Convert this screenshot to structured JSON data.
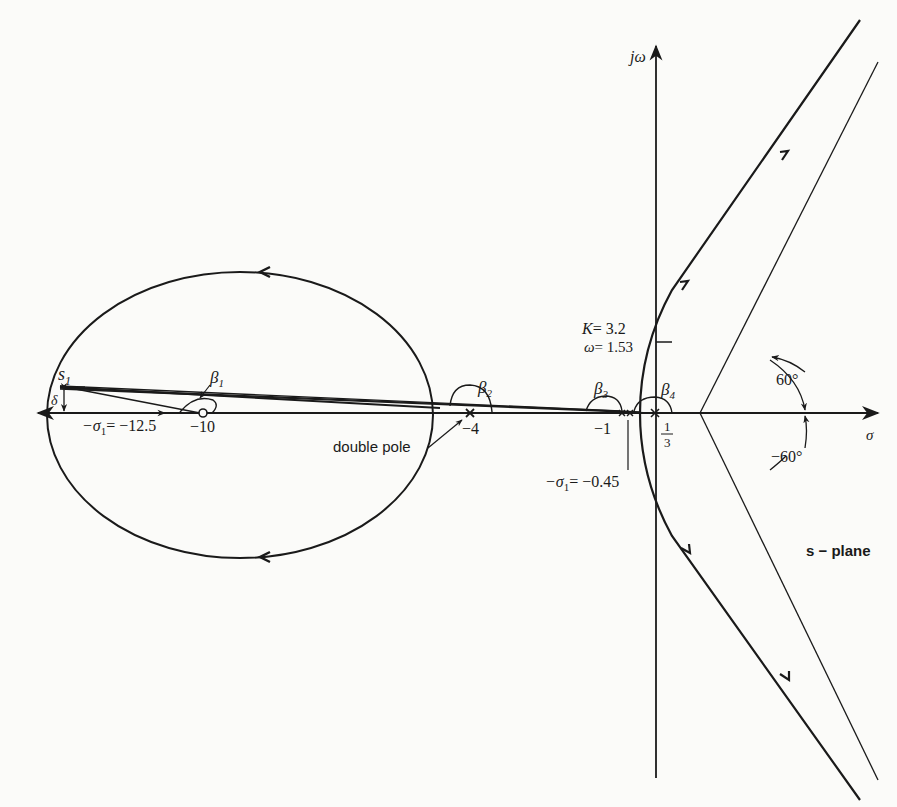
{
  "diagram": {
    "type": "root-locus",
    "plane_label": "s − plane",
    "axes": {
      "real_axis_label": "σ",
      "imag_axis_label": "jω"
    },
    "points": {
      "s1": "s",
      "s1_sub": "1",
      "delta": "δ",
      "sigma1_left": "−σ",
      "sigma1_left_sub": "1",
      "sigma1_left_value": "= −12.5",
      "zero_minus10": "−10",
      "double_pole_minus4": "−4",
      "double_pole_label": "double pole",
      "pole_minus1": "−1",
      "one_third_num": "1",
      "one_third_den": "3",
      "sigma1_right": "−σ",
      "sigma1_right_sub": "1",
      "sigma1_right_value": "= −0.45"
    },
    "angles": {
      "beta1": "β",
      "beta1_sub": "1",
      "beta2": "β",
      "beta2_sub": "2",
      "beta3": "β",
      "beta3_sub": "3",
      "beta4": "β",
      "beta4_sub": "4",
      "asymptote_up": "60°",
      "asymptote_down": "−60°"
    },
    "crossing": {
      "gain_label": "K",
      "gain_value": "= 3.2",
      "omega_label": "ω",
      "omega_value": "= 1.53"
    },
    "colors": {
      "ink": "#1a1a1a",
      "paper": "#fbfbf9"
    }
  }
}
